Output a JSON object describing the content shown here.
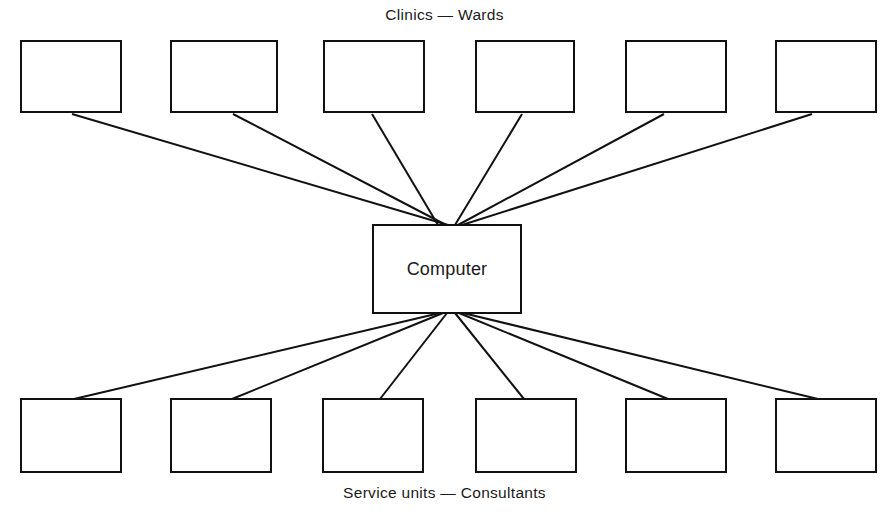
{
  "diagram": {
    "type": "hub-and-spoke",
    "background_color": "#ffffff",
    "line_color": "#111111",
    "line_width": 2,
    "canvas": {
      "width": 889,
      "height": 518
    },
    "hub": {
      "label": "Computer",
      "x": 372,
      "y": 224,
      "width": 150,
      "height": 90
    },
    "top_group": {
      "caption": "Clinics  —  Wards",
      "node_count": 6,
      "nodes": [
        {
          "label": "",
          "x": 20,
          "y": 40,
          "width": 102,
          "height": 73
        },
        {
          "label": "",
          "x": 170,
          "y": 40,
          "width": 108,
          "height": 73
        },
        {
          "label": "",
          "x": 323,
          "y": 40,
          "width": 102,
          "height": 73
        },
        {
          "label": "",
          "x": 475,
          "y": 40,
          "width": 100,
          "height": 73
        },
        {
          "label": "",
          "x": 625,
          "y": 40,
          "width": 102,
          "height": 73
        },
        {
          "label": "",
          "x": 775,
          "y": 40,
          "width": 102,
          "height": 73
        }
      ]
    },
    "bottom_group": {
      "caption": "Service units  —  Consultants",
      "node_count": 6,
      "nodes": [
        {
          "label": "",
          "x": 20,
          "y": 398,
          "width": 102,
          "height": 75
        },
        {
          "label": "",
          "x": 170,
          "y": 398,
          "width": 102,
          "height": 75
        },
        {
          "label": "",
          "x": 322,
          "y": 398,
          "width": 102,
          "height": 75
        },
        {
          "label": "",
          "x": 475,
          "y": 398,
          "width": 102,
          "height": 75
        },
        {
          "label": "",
          "x": 625,
          "y": 398,
          "width": 102,
          "height": 75
        },
        {
          "label": "",
          "x": 775,
          "y": 398,
          "width": 102,
          "height": 75
        }
      ]
    },
    "edges": [
      {
        "from": "top-node-1",
        "to": "hub",
        "x1": 72,
        "y1": 114,
        "x2": 448,
        "y2": 225
      },
      {
        "from": "top-node-2",
        "to": "hub",
        "x1": 233,
        "y1": 114,
        "x2": 446,
        "y2": 225
      },
      {
        "from": "top-node-3",
        "to": "hub",
        "x1": 372,
        "y1": 114,
        "x2": 438,
        "y2": 225
      },
      {
        "from": "top-node-4",
        "to": "hub",
        "x1": 522,
        "y1": 114,
        "x2": 455,
        "y2": 225
      },
      {
        "from": "top-node-5",
        "to": "hub",
        "x1": 664,
        "y1": 114,
        "x2": 458,
        "y2": 225
      },
      {
        "from": "top-node-6",
        "to": "hub",
        "x1": 812,
        "y1": 114,
        "x2": 462,
        "y2": 225
      },
      {
        "from": "hub",
        "to": "bottom-node-1",
        "x1": 440,
        "y1": 313,
        "x2": 74,
        "y2": 399
      },
      {
        "from": "hub",
        "to": "bottom-node-2",
        "x1": 443,
        "y1": 313,
        "x2": 232,
        "y2": 399
      },
      {
        "from": "hub",
        "to": "bottom-node-3",
        "x1": 447,
        "y1": 313,
        "x2": 380,
        "y2": 399
      },
      {
        "from": "hub",
        "to": "bottom-node-4",
        "x1": 455,
        "y1": 313,
        "x2": 524,
        "y2": 399
      },
      {
        "from": "hub",
        "to": "bottom-node-5",
        "x1": 459,
        "y1": 313,
        "x2": 668,
        "y2": 399
      },
      {
        "from": "hub",
        "to": "bottom-node-6",
        "x1": 463,
        "y1": 313,
        "x2": 818,
        "y2": 399
      }
    ]
  }
}
